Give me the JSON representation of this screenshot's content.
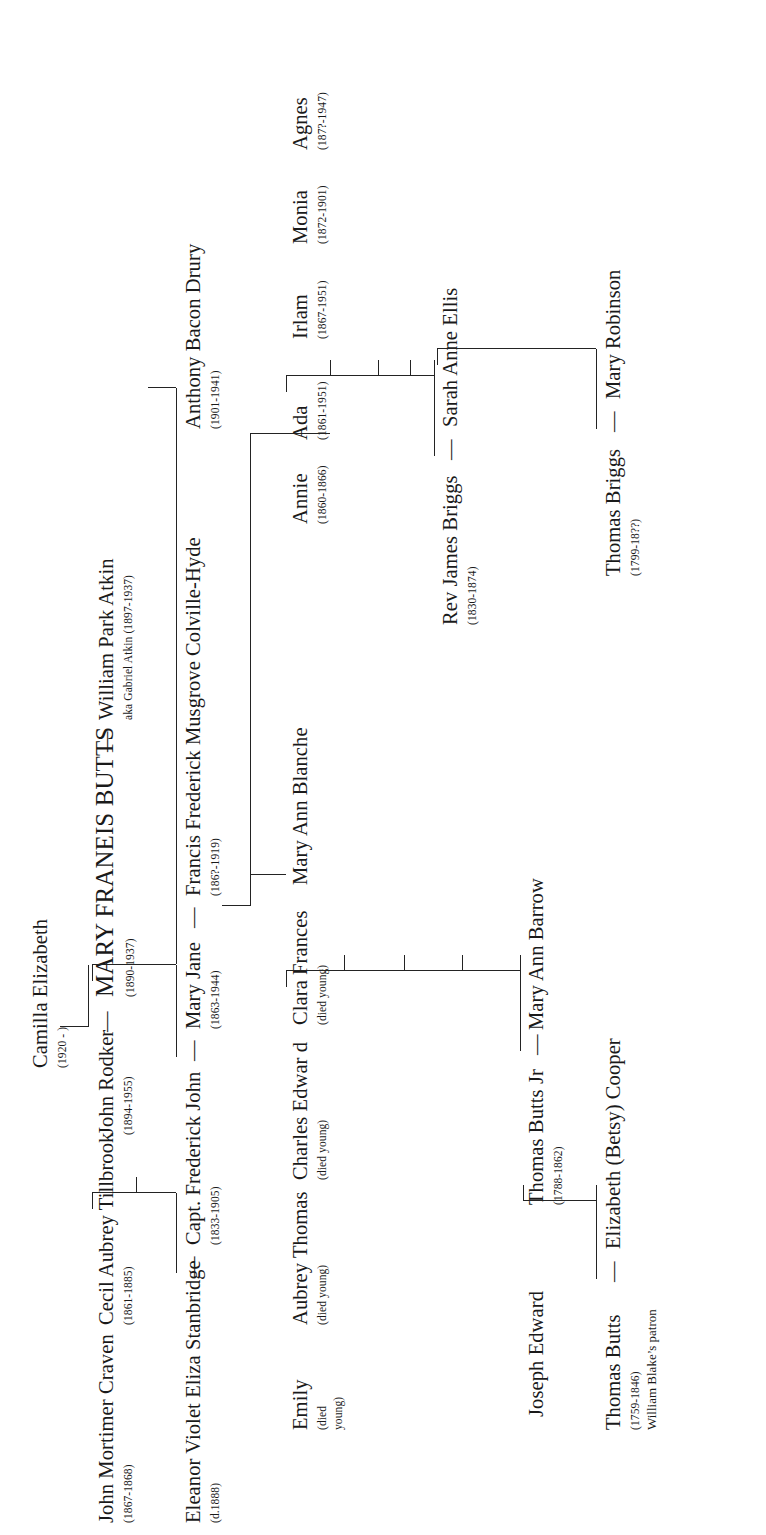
{
  "orientation": "rotated-90-ccw",
  "people": {
    "thomas_butts": {
      "name": "Thomas Butts",
      "dates": "(1759-1846)",
      "note": "William Blake’s patron"
    },
    "elizabeth_cooper": {
      "name": "Elizabeth (Betsy) Cooper"
    },
    "joseph_edward": {
      "name": "Joseph Edward"
    },
    "thomas_butts_jr": {
      "name": "Thomas Butts Jr",
      "dates": "(1788-1862)"
    },
    "mary_ann_barrow": {
      "name": "Mary Ann Barrow"
    },
    "emily": {
      "name": "Emily",
      "dates": "(died",
      "dates2": "young)"
    },
    "aubrey_thomas": {
      "name": "Aubrey Thomas",
      "dates": "(died young)"
    },
    "charles_edward": {
      "name": "Charles Edwar d",
      "dates": "(died young)"
    },
    "clara_frances": {
      "name": "Clara Frances",
      "dates": "(died young)"
    },
    "mary_ann_blanche": {
      "name": "Mary Ann Blanche"
    },
    "thomas_briggs": {
      "name": "Thomas Briggs",
      "dates": "(1799-18??)"
    },
    "mary_robinson": {
      "name": "Mary Robinson"
    },
    "rev_james_briggs": {
      "name": "Rev James Briggs",
      "dates": "(1830-1874)"
    },
    "sarah_anne_ellis": {
      "name": "Sarah Anne Ellis"
    },
    "annie": {
      "name": "Annie",
      "dates": "(1860-1866)"
    },
    "ada": {
      "name": "Ada",
      "dates": "(1861-1951)"
    },
    "irlam": {
      "name": "Irlam",
      "dates": "(1867-1951)"
    },
    "monia": {
      "name": "Monia",
      "dates": "(1872-1901)"
    },
    "agnes": {
      "name": "Agnes",
      "dates": "(187?-1947)"
    },
    "eleanor_stanbridge": {
      "name": "Eleanor Violet Eliza Stanbridge",
      "dates": "(d.1888)"
    },
    "capt_frederick_john": {
      "name": "Capt. Frederick John",
      "dates": "(1833-1905)"
    },
    "mary_jane": {
      "name": "Mary Jane",
      "dates": "(1863-1944)"
    },
    "francis_colville_hyde": {
      "name": "Francis Frederick Musgrove Colville-Hyde",
      "dates": "(186?-1919)"
    },
    "anthony_bacon_drury": {
      "name": "Anthony  Bacon  Drury",
      "dates": "(1901-1941)"
    },
    "john_mortimer_craven": {
      "name": "John Mortimer Craven",
      "dates": "(1867-1868)"
    },
    "cecil_aubrey_tillbrook": {
      "name": "Cecil Aubrey Tillbrook",
      "dates": "(1861-1885)"
    },
    "john_rodker": {
      "name": "John Rodker",
      "dates": "(1894-1955)"
    },
    "mary_franeis_butts": {
      "name": "MARY FRANEIS BUTTS",
      "dates": "(1890-1937)"
    },
    "william_park_atkin": {
      "name": "William Park  Atkin",
      "aka": "aka Gabriel  Atkin (1897-1937)"
    },
    "camilla_elizabeth": {
      "name": "Camilla Elizabeth",
      "dates": "(1920 -   )"
    }
  },
  "marriage_dash": "—",
  "colors": {
    "ink": "#1a1a1a",
    "line": "#232323",
    "background": "#ffffff"
  }
}
